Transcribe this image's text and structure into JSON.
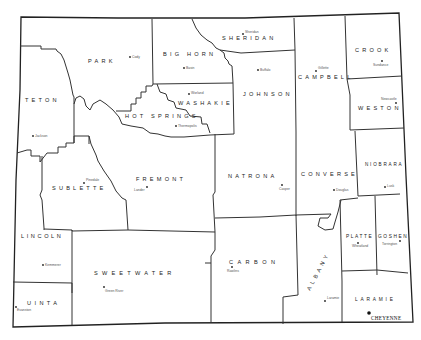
{
  "map": {
    "title": "Wyoming Counties",
    "colors": {
      "background": "#ffffff",
      "boundary": "#333333",
      "text": "#222222"
    },
    "counties": [
      {
        "name": "PARK",
        "seat": "Cody"
      },
      {
        "name": "BIG HORN",
        "seat": "Basin"
      },
      {
        "name": "SHERIDAN",
        "seat": "Sheridan"
      },
      {
        "name": "CAMPBELL",
        "seat": "Gillette"
      },
      {
        "name": "CROOK",
        "seat": "Sundance"
      },
      {
        "name": "TETON",
        "seat": "Jackson"
      },
      {
        "name": "WASHAKIE",
        "seat": "Worland"
      },
      {
        "name": "HOT SPRINGS",
        "seat": "Thermopolis"
      },
      {
        "name": "JOHNSON",
        "seat": "Buffalo"
      },
      {
        "name": "WESTON",
        "seat": "Newcastle"
      },
      {
        "name": "SUBLETTE",
        "seat": "Pinedale"
      },
      {
        "name": "FREMONT",
        "seat": "Lander"
      },
      {
        "name": "NATRONA",
        "seat": "Casper"
      },
      {
        "name": "CONVERSE",
        "seat": "Douglas"
      },
      {
        "name": "NIOBRARA",
        "seat": "Lusk"
      },
      {
        "name": "LINCOLN",
        "seat": "Kemmerer"
      },
      {
        "name": "SWEETWATER",
        "seat": "Green River"
      },
      {
        "name": "CARBON",
        "seat": "Rawlins"
      },
      {
        "name": "ALBANY",
        "seat": "Laramie"
      },
      {
        "name": "PLATTE",
        "seat": "Wheatland"
      },
      {
        "name": "GOSHEN",
        "seat": "Torrington"
      },
      {
        "name": "UINTA",
        "seat": "Evanston"
      },
      {
        "name": "LARAMIE",
        "seat": ""
      }
    ],
    "capital": {
      "name": "CHEYENNE"
    }
  }
}
